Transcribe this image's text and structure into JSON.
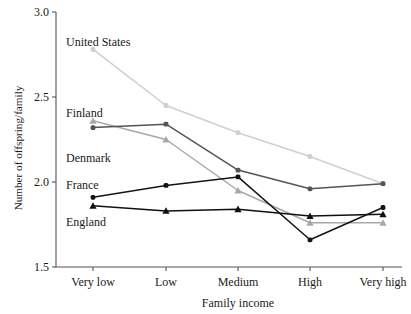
{
  "chart_data": {
    "type": "line",
    "title": "",
    "xlabel": "Family income",
    "ylabel": "Number of offspring/family",
    "categories": [
      "Very low",
      "Low",
      "Medium",
      "High",
      "Very high"
    ],
    "ylim": [
      1.5,
      3.0
    ],
    "yticks": [
      "1.5",
      "2.0",
      "2.5",
      "3.0"
    ],
    "ytick_values": [
      1.5,
      2.0,
      2.5,
      3.0
    ],
    "grid": false,
    "legend_position": "inline-left-labels",
    "series": [
      {
        "name": "United States",
        "values": [
          2.78,
          2.45,
          2.29,
          2.15,
          1.99
        ],
        "color": "#cfcfcf",
        "marker": "circle"
      },
      {
        "name": "Finland",
        "values": [
          2.36,
          2.25,
          1.95,
          1.76,
          1.76
        ],
        "color": "#a8a8a8",
        "marker": "triangle"
      },
      {
        "name": "Denmark",
        "values": [
          2.32,
          2.34,
          2.07,
          1.96,
          1.99
        ],
        "color": "#555555",
        "marker": "circle"
      },
      {
        "name": "France",
        "values": [
          1.91,
          1.98,
          2.03,
          1.66,
          1.85
        ],
        "color": "#151515",
        "marker": "circle"
      },
      {
        "name": "England",
        "values": [
          1.86,
          1.83,
          1.84,
          1.8,
          1.81
        ],
        "color": "#101010",
        "marker": "triangle"
      }
    ],
    "annotations": [
      {
        "text": "United States",
        "x": 66,
        "y": 46
      },
      {
        "text": "Finland",
        "x": 66,
        "y": 117
      },
      {
        "text": "Denmark",
        "x": 66,
        "y": 162
      },
      {
        "text": "France",
        "x": 66,
        "y": 189
      },
      {
        "text": "England",
        "x": 66,
        "y": 226
      }
    ]
  }
}
